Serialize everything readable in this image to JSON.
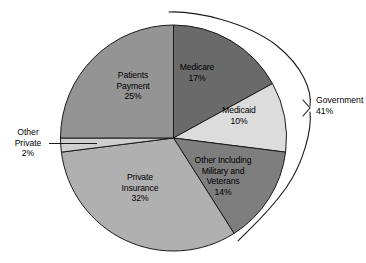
{
  "chart_data": {
    "type": "pie",
    "title": "",
    "subtitle": "",
    "xlabel": "",
    "ylabel": "",
    "legend_position": "none",
    "grid": false,
    "units": "percent",
    "total": 100,
    "categories": [
      "Medicare",
      "Medicaid",
      "Other Including Military and Veterans",
      "Private Insurance",
      "Other Private",
      "Patients Payment"
    ],
    "values": [
      17,
      10,
      14,
      32,
      2,
      25
    ],
    "colors": [
      "#6a6a6a",
      "#dcdcdc",
      "#7e7e7e",
      "#b0b0b0",
      "#cfcfcf",
      "#949494"
    ],
    "start_angle_deg": 0,
    "direction": "clockwise",
    "groups": [
      {
        "name": "Government",
        "value": 41,
        "members": [
          "Medicare",
          "Medicaid",
          "Other Including Military and Veterans"
        ]
      }
    ],
    "annotations": [
      {
        "name": "Government",
        "value": "41%",
        "style": "bracket",
        "side": "right"
      },
      {
        "name": "Other Private",
        "value": "2%",
        "style": "leader-line",
        "side": "left"
      }
    ]
  },
  "slices": [
    {
      "key": "medicare",
      "name_line1": "Medicare",
      "name_line2": "",
      "name_line3": "",
      "percent": "17%",
      "value": 17,
      "color": "#6a6a6a"
    },
    {
      "key": "medicaid",
      "name_line1": "Medicaid",
      "name_line2": "",
      "name_line3": "",
      "percent": "10%",
      "value": 10,
      "color": "#dcdcdc"
    },
    {
      "key": "other-military",
      "name_line1": "Other Including",
      "name_line2": "Military and",
      "name_line3": "Veterans",
      "percent": "14%",
      "value": 14,
      "color": "#7e7e7e"
    },
    {
      "key": "private-insurance",
      "name_line1": "Private",
      "name_line2": "Insurance",
      "name_line3": "",
      "percent": "32%",
      "value": 32,
      "color": "#b0b0b0"
    },
    {
      "key": "other-private",
      "name_line1": "Other",
      "name_line2": "Private",
      "name_line3": "",
      "percent": "2%",
      "value": 2,
      "color": "#cfcfcf"
    },
    {
      "key": "patients-payment",
      "name_line1": "Patients",
      "name_line2": "Payment",
      "name_line3": "",
      "percent": "25%",
      "value": 25,
      "color": "#949494"
    }
  ],
  "bracket": {
    "label": "Government",
    "percent": "41%",
    "value": 41
  },
  "style": {
    "stroke": "#1a1a1a",
    "background": "#ffffff",
    "text_color": "#000000"
  }
}
